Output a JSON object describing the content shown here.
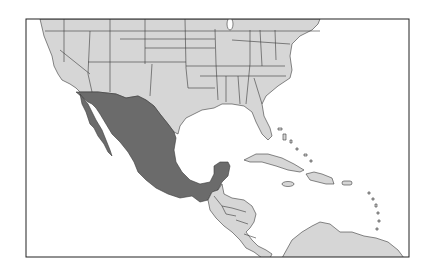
{
  "map": {
    "highlighted_country": "Mexico",
    "region": "North America, Central America and Caribbean",
    "colors": {
      "background": "#ffffff",
      "land": "#d6d6d6",
      "highlight": "#6b6b6b",
      "border": "#3a3a3a",
      "frame": "#222222"
    }
  }
}
